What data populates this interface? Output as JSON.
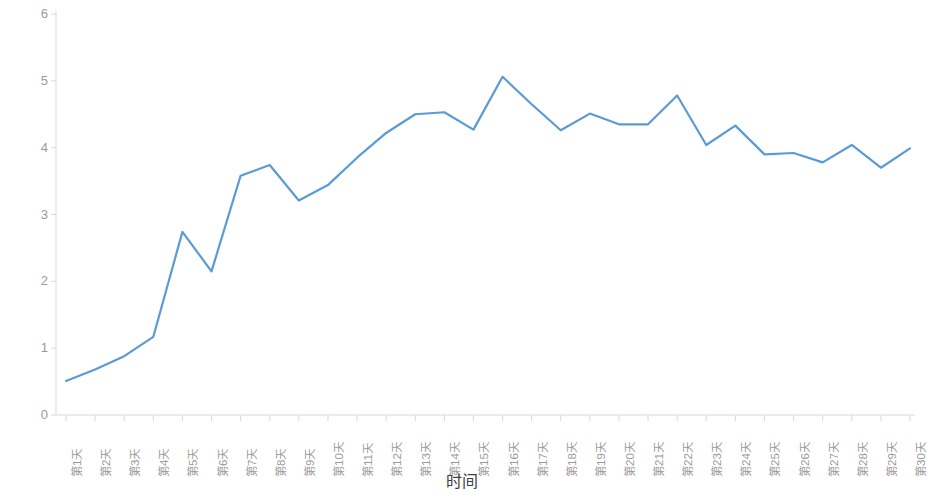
{
  "chart_data": {
    "type": "line",
    "title": "",
    "xlabel": "时间",
    "ylabel": "转化率/%",
    "ylim": [
      0,
      6
    ],
    "ytick_labels": [
      "0",
      "1",
      "2",
      "3",
      "4",
      "5",
      "6"
    ],
    "ytick_values": [
      0,
      1,
      2,
      3,
      4,
      5,
      6
    ],
    "grid": false,
    "legend": null,
    "line_color": "#5B9BD5",
    "axis_color": "#D9D9D9",
    "tick_text_color": "#9A9A9A",
    "categories": [
      "第1天",
      "第2天",
      "第3天",
      "第4天",
      "第5天",
      "第6天",
      "第7天",
      "第8天",
      "第9天",
      "第10天",
      "第11天",
      "第12天",
      "第13天",
      "第14天",
      "第15天",
      "第16天",
      "第17天",
      "第18天",
      "第19天",
      "第20天",
      "第21天",
      "第22天",
      "第23天",
      "第24天",
      "第25天",
      "第26天",
      "第27天",
      "第28天",
      "第29天",
      "第30天"
    ],
    "values": [
      0.51,
      0.68,
      0.88,
      1.17,
      2.74,
      2.15,
      3.58,
      3.74,
      3.21,
      3.44,
      3.85,
      4.22,
      4.5,
      4.53,
      4.27,
      5.06,
      4.65,
      4.26,
      4.51,
      4.35,
      4.35,
      4.78,
      4.04,
      4.33,
      3.9,
      3.92,
      3.78,
      4.04,
      3.7,
      3.99
    ]
  }
}
